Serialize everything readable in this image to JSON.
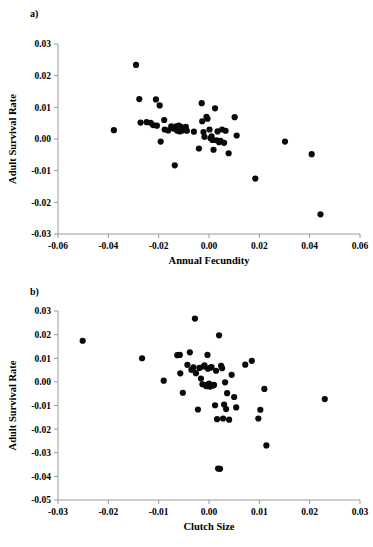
{
  "figure": {
    "panel_a_label": "a)",
    "panel_b_label": "b)"
  },
  "chart_data": [
    {
      "id": "panel-a",
      "type": "scatter",
      "title": "",
      "xlabel": "Annual Fecundity",
      "ylabel": "Adult Survival Rate",
      "xlim": [
        -0.06,
        0.06
      ],
      "ylim": [
        -0.03,
        0.03
      ],
      "xticks": [
        -0.06,
        -0.04,
        -0.02,
        0.0,
        0.02,
        0.04,
        0.06
      ],
      "xticklabels": [
        "-0.06",
        "-0.04",
        "-0.02",
        "0.00",
        "0.02",
        "0.04",
        "0.06"
      ],
      "yticks": [
        -0.03,
        -0.02,
        -0.01,
        0.0,
        0.01,
        0.02,
        0.03
      ],
      "yticklabels": [
        "-0.03",
        "-0.02",
        "-0.01",
        "0.00",
        "0.01",
        "0.02",
        "0.03"
      ],
      "grid": false,
      "legend": false,
      "marker": "circle",
      "marker_color": "#0a0a0a",
      "points": [
        [
          -0.0378,
          0.0028
        ],
        [
          -0.029,
          0.0234
        ],
        [
          -0.0277,
          0.0126
        ],
        [
          -0.0272,
          0.0052
        ],
        [
          -0.0248,
          0.0053
        ],
        [
          -0.0232,
          0.0051
        ],
        [
          -0.0222,
          0.0044
        ],
        [
          -0.0211,
          0.0125
        ],
        [
          -0.0207,
          0.0042
        ],
        [
          -0.0196,
          0.0106
        ],
        [
          -0.0192,
          -0.0008
        ],
        [
          -0.0178,
          0.006
        ],
        [
          -0.0176,
          0.003
        ],
        [
          -0.0162,
          0.0027
        ],
        [
          -0.015,
          0.004
        ],
        [
          -0.0141,
          0.0033
        ],
        [
          -0.0136,
          -0.0083
        ],
        [
          -0.013,
          0.004
        ],
        [
          -0.0126,
          0.0026
        ],
        [
          -0.012,
          0.0042
        ],
        [
          -0.0116,
          0.0024
        ],
        [
          -0.0112,
          0.0038
        ],
        [
          -0.0106,
          0.0027
        ],
        [
          -0.0092,
          0.0038
        ],
        [
          -0.0088,
          0.0026
        ],
        [
          -0.006,
          0.0023
        ],
        [
          -0.004,
          -0.003
        ],
        [
          -0.0029,
          0.0113
        ],
        [
          -0.0027,
          0.0056
        ],
        [
          -0.0022,
          0.0022
        ],
        [
          -0.0018,
          0.0007
        ],
        [
          -0.001,
          0.007
        ],
        [
          -0.0006,
          0.0064
        ],
        [
          0.0002,
          0.003
        ],
        [
          0.0006,
          0.0002
        ],
        [
          0.001,
          0.0008
        ],
        [
          0.0014,
          -0.0003
        ],
        [
          0.0018,
          -0.0034
        ],
        [
          0.0024,
          0.0097
        ],
        [
          0.003,
          -0.0004
        ],
        [
          0.0034,
          0.0024
        ],
        [
          0.004,
          -0.001
        ],
        [
          0.0046,
          -0.0006
        ],
        [
          0.0052,
          0.003
        ],
        [
          0.006,
          -0.0012
        ],
        [
          0.0066,
          0.0026
        ],
        [
          0.0078,
          -0.0045
        ],
        [
          0.0102,
          0.0069
        ],
        [
          0.011,
          0.0011
        ],
        [
          0.0184,
          -0.0125
        ],
        [
          0.0302,
          -0.0008
        ],
        [
          0.0408,
          -0.0048
        ],
        [
          0.0443,
          -0.0238
        ]
      ]
    },
    {
      "id": "panel-b",
      "type": "scatter",
      "title": "",
      "xlabel": "Clutch Size",
      "ylabel": "Adult Survival Rate",
      "xlim": [
        -0.03,
        0.03
      ],
      "ylim": [
        -0.05,
        0.03
      ],
      "xticks": [
        -0.03,
        -0.02,
        -0.01,
        0.0,
        0.01,
        0.02,
        0.03
      ],
      "xticklabels": [
        "-0.03",
        "-0.02",
        "-0.01",
        "0.00",
        "0.01",
        "0.02",
        "0.03"
      ],
      "yticks": [
        -0.05,
        -0.04,
        -0.03,
        -0.02,
        -0.01,
        0.0,
        0.01,
        0.02,
        0.03
      ],
      "yticklabels": [
        "-0.05",
        "-0.04",
        "-0.03",
        "-0.02",
        "-0.01",
        "0.00",
        "0.01",
        "0.02",
        "0.03"
      ],
      "grid": false,
      "legend": false,
      "marker": "circle",
      "marker_color": "#0a0a0a",
      "points": [
        [
          -0.0251,
          0.0174
        ],
        [
          -0.0133,
          0.01
        ],
        [
          -0.009,
          0.0005
        ],
        [
          -0.0063,
          0.0113
        ],
        [
          -0.0058,
          0.0114
        ],
        [
          -0.0057,
          0.0036
        ],
        [
          -0.0052,
          -0.0046
        ],
        [
          -0.0043,
          0.0072
        ],
        [
          -0.0038,
          0.0125
        ],
        [
          -0.0035,
          0.0051
        ],
        [
          -0.0031,
          0.0061
        ],
        [
          -0.0028,
          0.0268
        ],
        [
          -0.0026,
          0.0037
        ],
        [
          -0.0022,
          -0.0117
        ],
        [
          -0.0019,
          0.0059
        ],
        [
          -0.0016,
          0.0014
        ],
        [
          -0.0013,
          -0.001
        ],
        [
          -0.0011,
          0.0065
        ],
        [
          -0.0009,
          0.007
        ],
        [
          -0.0007,
          -0.0014
        ],
        [
          -0.0005,
          -0.0018
        ],
        [
          -0.0003,
          0.0114
        ],
        [
          -0.0002,
          0.0056
        ],
        [
          0.0,
          -0.0007
        ],
        [
          0.0002,
          -0.002
        ],
        [
          0.0003,
          0.006
        ],
        [
          0.0005,
          0.0063
        ],
        [
          0.0007,
          -0.0016
        ],
        [
          0.001,
          -0.0013
        ],
        [
          0.0012,
          -0.0099
        ],
        [
          0.0014,
          0.0047
        ],
        [
          0.0016,
          -0.0158
        ],
        [
          0.0018,
          -0.0367
        ],
        [
          0.002,
          0.0197
        ],
        [
          0.0022,
          -0.0368
        ],
        [
          0.0024,
          0.0068
        ],
        [
          0.0026,
          0.0058
        ],
        [
          0.0028,
          -0.0155
        ],
        [
          0.003,
          -0.0096
        ],
        [
          0.0032,
          -0.0002
        ],
        [
          0.0034,
          -0.0115
        ],
        [
          0.0036,
          -0.0048
        ],
        [
          0.004,
          -0.016
        ],
        [
          0.0045,
          0.003
        ],
        [
          0.005,
          -0.0064
        ],
        [
          0.0054,
          -0.0108
        ],
        [
          0.0072,
          0.0073
        ],
        [
          0.0085,
          0.0089
        ],
        [
          0.0098,
          -0.0155
        ],
        [
          0.0102,
          -0.0118
        ],
        [
          0.011,
          -0.003
        ],
        [
          0.0114,
          -0.0269
        ],
        [
          0.023,
          -0.0073
        ]
      ]
    }
  ]
}
